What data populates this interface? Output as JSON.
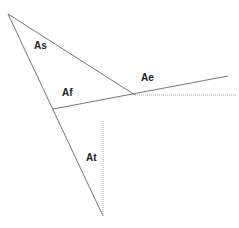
{
  "diagram": {
    "labels": {
      "as": "As",
      "af": "Af",
      "ae": "Ae",
      "at": "At"
    },
    "colors": {
      "line": "#777777",
      "dotted": "#aaaaaa",
      "text": "#222222"
    }
  }
}
